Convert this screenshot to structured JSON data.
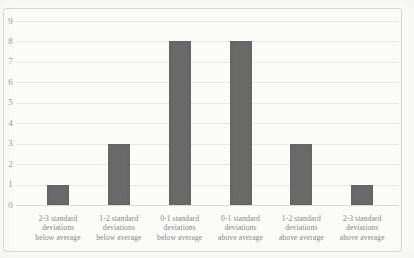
{
  "chart_data": {
    "type": "bar",
    "title": "",
    "xlabel": "",
    "ylabel": "",
    "categories": [
      "2-3 standard\ndeviations\nbelow average",
      "1-2 standard\ndeviations\nbelow average",
      "0-1 standard\ndeviations\nbelow average",
      "0-1 standard\ndeviations\nabove average",
      "1-2 standard\ndeviations\nabove average",
      "2-3 standard\ndeviations\nabove average"
    ],
    "values": [
      1,
      3,
      8,
      8,
      3,
      1
    ],
    "ylim": [
      0,
      9
    ],
    "yticks": [
      0,
      1,
      2,
      3,
      4,
      5,
      6,
      7,
      8,
      9
    ],
    "grid": true,
    "legend_position": "none",
    "colors": {
      "bar": "#6a6a6a",
      "gridline": "#e9e9e4",
      "axis_line": "#dbdbd6",
      "y_tick_text": "#99999a",
      "x_label_text": "#87878a",
      "frame_border": "#d7d7d2",
      "background": "#fbfbf8"
    }
  }
}
